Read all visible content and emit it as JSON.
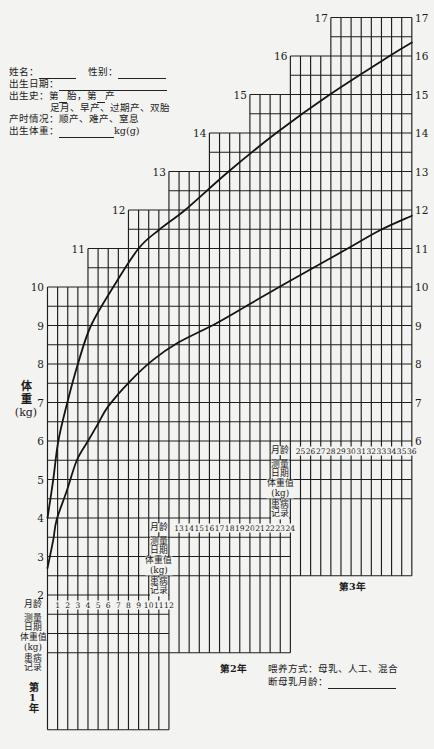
{
  "patient_info": {
    "name_label": "姓名：",
    "name_value": "",
    "sex_label": "性别：",
    "sex_value": "",
    "birth_date_label": "出生日期：",
    "birth_date_value": "",
    "birth_history_label": "出生史：第",
    "pregnancy_no_value": "",
    "birth_history_mid": "胎，第",
    "parity_no_value": "",
    "birth_history_suffix": "产",
    "term_options": "足月、早产、过期产、双胎",
    "delivery_label": "产时情况：",
    "delivery_options": "顺产、难产、窒息",
    "birth_weight_label": "出生体重：",
    "birth_weight_value": "",
    "birth_weight_unit": "kg(g)"
  },
  "axis": {
    "ylabel_lines": [
      "体",
      "重",
      "(kg)"
    ]
  },
  "record_table": {
    "row_labels": [
      [
        "月龄"
      ],
      [
        "测量",
        "日期"
      ],
      [
        "体重值",
        "(kg)"
      ],
      [
        "患病",
        "记录"
      ]
    ],
    "year_labels": [
      "第1年",
      "第2年",
      "第3年"
    ]
  },
  "feeding": {
    "label": "喂养方式：母乳、人工、混合",
    "weaning_label": "断母乳月龄：",
    "weaning_value": ""
  },
  "chart_data": {
    "type": "line",
    "title": "",
    "xlabel": "月龄",
    "ylabel": "体重 (kg)",
    "x_range": [
      0,
      36
    ],
    "ylim": [
      2,
      17
    ],
    "grid": true,
    "y_minor_step": 0.5,
    "left_ticks": [
      10,
      9,
      8,
      7,
      6,
      5,
      4,
      3,
      2
    ],
    "step_ticks": [
      {
        "kg": 11,
        "month": 4
      },
      {
        "kg": 12,
        "month": 8
      },
      {
        "kg": 13,
        "month": 12
      },
      {
        "kg": 14,
        "month": 16
      },
      {
        "kg": 15,
        "month": 20
      },
      {
        "kg": 16,
        "month": 24
      },
      {
        "kg": 17,
        "month": 28
      }
    ],
    "right_ticks": [
      17,
      16,
      15,
      14,
      13,
      12,
      11,
      10,
      9,
      8,
      7,
      6
    ],
    "grid_tops": [
      {
        "from_month": 0,
        "to_month": 4,
        "top_kg": 10
      },
      {
        "from_month": 4,
        "to_month": 8,
        "top_kg": 11
      },
      {
        "from_month": 8,
        "to_month": 12,
        "top_kg": 12
      },
      {
        "from_month": 12,
        "to_month": 16,
        "top_kg": 13
      },
      {
        "from_month": 16,
        "to_month": 20,
        "top_kg": 14
      },
      {
        "from_month": 20,
        "to_month": 24,
        "top_kg": 15
      },
      {
        "from_month": 24,
        "to_month": 28,
        "top_kg": 16
      },
      {
        "from_month": 28,
        "to_month": 36,
        "top_kg": 17
      }
    ],
    "series": [
      {
        "name": "upper curve",
        "points": [
          [
            0,
            4.0
          ],
          [
            0.57,
            5.0
          ],
          [
            1.07,
            6.0
          ],
          [
            1.96,
            7.0
          ],
          [
            3.0,
            8.0
          ],
          [
            4.3,
            9.0
          ],
          [
            6.5,
            10.0
          ],
          [
            9.0,
            11.0
          ],
          [
            11.1,
            11.5
          ],
          [
            13.6,
            12.0
          ],
          [
            17.9,
            13.0
          ],
          [
            22.6,
            14.0
          ],
          [
            27.9,
            15.0
          ],
          [
            33.8,
            16.0
          ],
          [
            36,
            16.35
          ]
        ]
      },
      {
        "name": "lower curve",
        "points": [
          [
            0,
            2.7
          ],
          [
            0.57,
            3.43
          ],
          [
            0.9,
            3.95
          ],
          [
            1.9,
            4.7
          ],
          [
            2.9,
            5.5
          ],
          [
            4.0,
            6.0
          ],
          [
            5.0,
            6.45
          ],
          [
            6.0,
            6.9
          ],
          [
            8.15,
            7.55
          ],
          [
            10.4,
            8.1
          ],
          [
            12.8,
            8.54
          ],
          [
            16.7,
            9.06
          ],
          [
            20.0,
            9.56
          ],
          [
            22.9,
            10.0
          ],
          [
            25.0,
            10.31
          ],
          [
            29.4,
            10.96
          ],
          [
            32.9,
            11.48
          ],
          [
            36,
            11.85
          ]
        ]
      }
    ],
    "years": [
      {
        "from_month": 0,
        "to_month": 12,
        "grid_bottom_kg": 2,
        "months": [
          1,
          2,
          3,
          4,
          5,
          6,
          7,
          8,
          9,
          10,
          11,
          12
        ]
      },
      {
        "from_month": 12,
        "to_month": 24,
        "grid_bottom_kg": 4,
        "months": [
          13,
          14,
          15,
          16,
          17,
          18,
          19,
          20,
          21,
          22,
          23,
          24
        ]
      },
      {
        "from_month": 24,
        "to_month": 36,
        "grid_bottom_kg": 6,
        "months": [
          25,
          26,
          27,
          28,
          29,
          30,
          31,
          32,
          33,
          34,
          35,
          36
        ]
      }
    ]
  }
}
